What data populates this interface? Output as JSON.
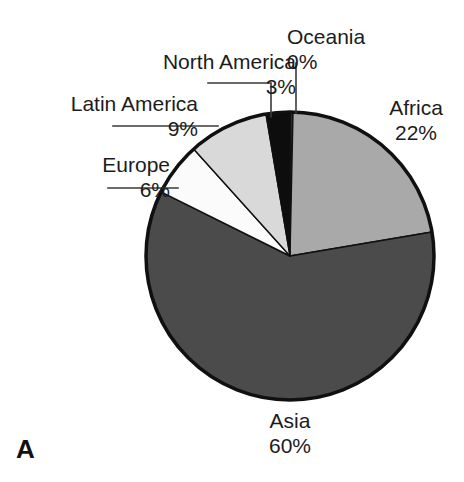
{
  "panel": {
    "letter": "A"
  },
  "chart_data": {
    "type": "pie",
    "title": "",
    "subtitle": "",
    "xlabel": "",
    "ylabel": "",
    "legend_position": "none",
    "grid": false,
    "units": "percent",
    "start_angle_deg": 0,
    "direction": "clockwise",
    "categories": [
      "Oceania",
      "Africa",
      "Asia",
      "Europe",
      "Latin America",
      "North America"
    ],
    "values": [
      0,
      22,
      60,
      6,
      9,
      3
    ],
    "slices": [
      {
        "label": "Oceania",
        "value": 0,
        "value_text": "0%",
        "color": "#2b2b2b",
        "start_deg": 0,
        "end_deg": 1.2,
        "label_align": "left",
        "leader": "vertical"
      },
      {
        "label": "Africa",
        "value": 22,
        "value_text": "22%",
        "color": "#a9a9a9",
        "start_deg": 1.2,
        "end_deg": 80.4,
        "label_align": "center",
        "leader": "none"
      },
      {
        "label": "Asia",
        "value": 60,
        "value_text": "60%",
        "color": "#4b4b4b",
        "start_deg": 80.4,
        "end_deg": 296.4,
        "label_align": "center",
        "leader": "none"
      },
      {
        "label": "Europe",
        "value": 6,
        "value_text": "6%",
        "color": "#fbfbfb",
        "start_deg": 296.4,
        "end_deg": 318.0,
        "label_align": "right",
        "leader": "horizontal"
      },
      {
        "label": "Latin America",
        "value": 9,
        "value_text": "9%",
        "color": "#d9d9d9",
        "start_deg": 318.0,
        "end_deg": 350.4,
        "label_align": "right",
        "leader": "horizontal"
      },
      {
        "label": "North America",
        "value": 3,
        "value_text": "3%",
        "color": "#0d0d0d",
        "start_deg": 350.4,
        "end_deg": 360.0,
        "label_align": "right",
        "leader": "elbow"
      }
    ],
    "colors": {
      "oceania": "#2b2b2b",
      "africa": "#a9a9a9",
      "asia": "#4b4b4b",
      "europe": "#fbfbfb",
      "latin_america": "#d9d9d9",
      "north_america": "#0d0d0d",
      "outline": "#101010",
      "background": "#ffffff",
      "text": "#1c1c1c"
    },
    "geometry": {
      "center_x": 290,
      "center_y": 256,
      "radius": 144
    }
  },
  "labels": {
    "oceania": {
      "name": "Oceania",
      "pct": "0%"
    },
    "north_america": {
      "name": "North America",
      "pct": "3%"
    },
    "latin_america": {
      "name": "Latin America",
      "pct": "9%"
    },
    "europe": {
      "name": "Europe",
      "pct": "6%"
    },
    "africa": {
      "name": "Africa",
      "pct": "22%"
    },
    "asia": {
      "name": "Asia",
      "pct": "60%"
    }
  }
}
